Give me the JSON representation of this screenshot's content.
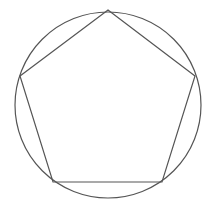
{
  "diagram": {
    "title": "",
    "stroke_color": "#555555",
    "background": "#ffffff",
    "circle": {
      "cx": 108,
      "cy": 105,
      "r": 93
    },
    "pentagon": {
      "vertices": [
        [
          108,
          10
        ],
        [
          195,
          76
        ],
        [
          162,
          182
        ],
        [
          53,
          182
        ],
        [
          20,
          76
        ]
      ]
    }
  }
}
